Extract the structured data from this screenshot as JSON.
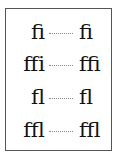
{
  "rows": [
    {
      "left": "fi",
      "right": "ﬁ"
    },
    {
      "left": "ffi",
      "right": "ﬃ"
    },
    {
      "left": "fl",
      "right": "ﬂ"
    },
    {
      "left": "ffl",
      "right": "ﬄ"
    }
  ]
}
